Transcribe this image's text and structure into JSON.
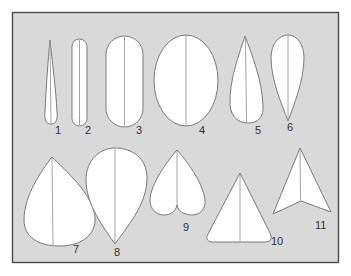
{
  "diagram": {
    "colors": {
      "panel_fill": "#d9d9d9",
      "panel_border": "#4a4a4a",
      "leaf_fill": "#ffffff",
      "leaf_outline": "#7a7a7a",
      "label_text": "#333333"
    },
    "shapes": [
      {
        "id": 1,
        "label": "1",
        "shape": "linear-tapering"
      },
      {
        "id": 2,
        "label": "2",
        "shape": "linear-oblong"
      },
      {
        "id": 3,
        "label": "3",
        "shape": "oblong"
      },
      {
        "id": 4,
        "label": "4",
        "shape": "elliptic"
      },
      {
        "id": 5,
        "label": "5",
        "shape": "lanceolate"
      },
      {
        "id": 6,
        "label": "6",
        "shape": "oblanceolate"
      },
      {
        "id": 7,
        "label": "7",
        "shape": "ovate"
      },
      {
        "id": 8,
        "label": "8",
        "shape": "obovate"
      },
      {
        "id": 9,
        "label": "9",
        "shape": "obcordate"
      },
      {
        "id": 10,
        "label": "10",
        "shape": "deltoid"
      },
      {
        "id": 11,
        "label": "11",
        "shape": "sagittate"
      }
    ]
  }
}
